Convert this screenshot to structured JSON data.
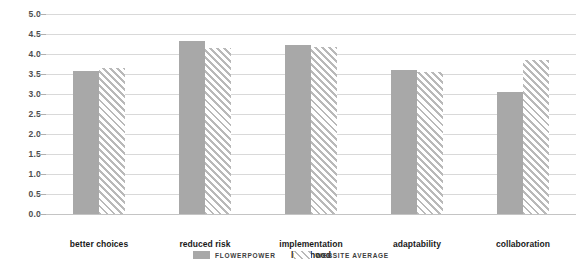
{
  "chart_data": {
    "type": "bar",
    "title": "",
    "subtitle": "",
    "xlabel": "",
    "ylabel": "",
    "ylim": [
      0.0,
      5.0
    ],
    "yticks": [
      "0.0",
      "0.5",
      "1.0",
      "1.5",
      "2.0",
      "2.5",
      "3.0",
      "3.5",
      "4.0",
      "4.5",
      "5.0"
    ],
    "ytick_values": [
      0.0,
      0.5,
      1.0,
      1.5,
      2.0,
      2.5,
      3.0,
      3.5,
      4.0,
      4.5,
      5.0
    ],
    "grid": true,
    "legend_position": "bottom-center",
    "categories": [
      "better choices",
      "reduced risk",
      "implementation\nlikelihood",
      "adaptability",
      "collaboration"
    ],
    "series": [
      {
        "name": "FLOWERPOWER",
        "style": "solid",
        "color": "#a8a8a8",
        "values": [
          3.58,
          4.33,
          4.22,
          3.6,
          3.05
        ]
      },
      {
        "name": "WEBSITE AVERAGE",
        "style": "diagonal-hatch",
        "color": "#b9b9b9",
        "values": [
          3.65,
          4.15,
          4.17,
          3.55,
          3.85
        ]
      }
    ]
  },
  "legend": {
    "items": [
      {
        "label": "FLOWERPOWER",
        "swatch": "solid-swatch-icon"
      },
      {
        "label": "WEBSITE AVERAGE",
        "swatch": "hatch-swatch-icon"
      }
    ]
  },
  "colors": {
    "bar_solid": "#a8a8a8",
    "bar_hatch": "#b9b9b9",
    "gridline": "#d9d9d9",
    "baseline": "#c4c4c4",
    "tick_text": "#4d4d4d",
    "category_text": "#1a1a1a",
    "legend_text": "#3d3d3d",
    "background": "#ffffff"
  }
}
